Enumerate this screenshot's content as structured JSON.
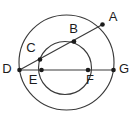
{
  "figure": {
    "type": "geometry-diagram",
    "canvas": {
      "width": 137,
      "height": 118
    },
    "background_color": "#ffffff",
    "stroke_color": "#3a3a3a",
    "label_color": "#1c1c1c",
    "shapes": {
      "large_circle": {
        "cx": 66.5,
        "cy": 62.5,
        "r": 47.5
      },
      "small_circle": {
        "cx": 65.0,
        "cy": 68.0,
        "r": 26.5
      }
    },
    "lines": [
      {
        "name": "line-D-A",
        "x1": 19.5,
        "y1": 70.0,
        "x2": 102.5,
        "y2": 24.5
      },
      {
        "name": "line-D-G",
        "x1": 19.5,
        "y1": 70.0,
        "x2": 113.5,
        "y2": 70.0
      }
    ],
    "points": [
      {
        "id": "A",
        "label": "A",
        "x": 102.5,
        "y": 24.5,
        "label_x": 113.0,
        "label_y": 18.0
      },
      {
        "id": "B",
        "label": "B",
        "x": 74.0,
        "y": 41.5,
        "label_x": 73.5,
        "label_y": 30.0
      },
      {
        "id": "C",
        "label": "C",
        "x": 40.0,
        "y": 59.5,
        "label_x": 31.0,
        "label_y": 49.0
      },
      {
        "id": "D",
        "label": "D",
        "x": 19.5,
        "y": 70.0,
        "label_x": 7.0,
        "label_y": 70.0
      },
      {
        "id": "E",
        "label": "E",
        "x": 41.5,
        "y": 70.0,
        "label_x": 33.0,
        "label_y": 81.0
      },
      {
        "id": "F",
        "label": "F",
        "x": 88.0,
        "y": 70.0,
        "label_x": 90.0,
        "label_y": 81.0
      },
      {
        "id": "G",
        "label": "G",
        "x": 113.5,
        "y": 70.0,
        "label_x": 124.0,
        "label_y": 70.0
      }
    ]
  }
}
